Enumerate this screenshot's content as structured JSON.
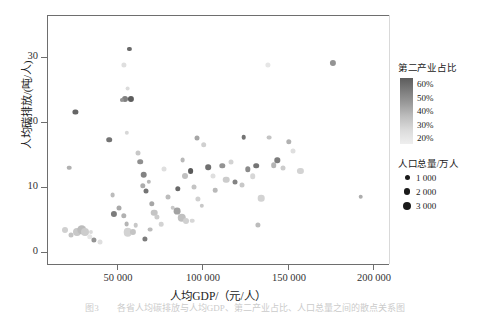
{
  "chart_data": {
    "type": "scatter",
    "title": "",
    "xlabel": "人均GDP/（元/人）",
    "ylabel": "人均碳排放/(吨/人)",
    "xlim": [
      12000,
      205000
    ],
    "ylim": [
      -1.5,
      34
    ],
    "xticks": [
      50000,
      100000,
      150000,
      200000
    ],
    "xticklabels": [
      "50 000",
      "100 000",
      "150 000",
      "200 000"
    ],
    "yticks": [
      0,
      10,
      20,
      30
    ],
    "yticklabels": [
      "0",
      "10",
      "20",
      "30"
    ],
    "grid": false,
    "legend_position": "right",
    "color_variable": "第二产业占比",
    "size_variable": "人口总量/万人",
    "points": [
      {
        "x": 28000,
        "y": 20.2,
        "c": 0.56,
        "s": 5.2
      },
      {
        "x": 24500,
        "y": 12.2,
        "c": 0.36,
        "s": 4.6
      },
      {
        "x": 22000,
        "y": 3.3,
        "c": 0.28,
        "s": 6.0
      },
      {
        "x": 25500,
        "y": 2.6,
        "c": 0.31,
        "s": 5.0
      },
      {
        "x": 29000,
        "y": 3.0,
        "c": 0.3,
        "s": 8.0
      },
      {
        "x": 31500,
        "y": 3.4,
        "c": 0.33,
        "s": 9.5
      },
      {
        "x": 33500,
        "y": 3.0,
        "c": 0.29,
        "s": 8.0
      },
      {
        "x": 36000,
        "y": 2.4,
        "c": 0.22,
        "s": 5.5
      },
      {
        "x": 38500,
        "y": 2.0,
        "c": 0.44,
        "s": 5.2
      },
      {
        "x": 37000,
        "y": 3.1,
        "c": 0.25,
        "s": 4.2
      },
      {
        "x": 42000,
        "y": 1.6,
        "c": 0.24,
        "s": 5.0
      },
      {
        "x": 47000,
        "y": 16.2,
        "c": 0.52,
        "s": 5.6
      },
      {
        "x": 50000,
        "y": 5.6,
        "c": 0.5,
        "s": 6.2
      },
      {
        "x": 49000,
        "y": 8.3,
        "c": 0.33,
        "s": 4.8
      },
      {
        "x": 52500,
        "y": 6.5,
        "c": 0.38,
        "s": 5.0
      },
      {
        "x": 55500,
        "y": 5.4,
        "c": 0.36,
        "s": 5.4
      },
      {
        "x": 57000,
        "y": 4.2,
        "c": 0.35,
        "s": 4.8
      },
      {
        "x": 57500,
        "y": 3.0,
        "c": 0.27,
        "s": 8.5
      },
      {
        "x": 60500,
        "y": 3.1,
        "c": 0.31,
        "s": 6.2
      },
      {
        "x": 62000,
        "y": 4.0,
        "c": 0.3,
        "s": 4.6
      },
      {
        "x": 58500,
        "y": 29.2,
        "c": 0.55,
        "s": 4.2
      },
      {
        "x": 55500,
        "y": 26.9,
        "c": 0.24,
        "s": 5.2
      },
      {
        "x": 57500,
        "y": 23.5,
        "c": 0.25,
        "s": 4.8
      },
      {
        "x": 56000,
        "y": 22.0,
        "c": 0.49,
        "s": 6.0
      },
      {
        "x": 59500,
        "y": 22.0,
        "c": 0.58,
        "s": 6.2
      },
      {
        "x": 54500,
        "y": 21.9,
        "c": 0.44,
        "s": 4.2
      },
      {
        "x": 57000,
        "y": 17.2,
        "c": 0.26,
        "s": 4.4
      },
      {
        "x": 63500,
        "y": 14.3,
        "c": 0.3,
        "s": 5.0
      },
      {
        "x": 64500,
        "y": 13.1,
        "c": 0.45,
        "s": 5.6
      },
      {
        "x": 66500,
        "y": 11.2,
        "c": 0.48,
        "s": 6.6
      },
      {
        "x": 66000,
        "y": 9.6,
        "c": 0.37,
        "s": 5.4
      },
      {
        "x": 68000,
        "y": 8.9,
        "c": 0.52,
        "s": 5.0
      },
      {
        "x": 69500,
        "y": 10.2,
        "c": 0.34,
        "s": 4.4
      },
      {
        "x": 71000,
        "y": 7.1,
        "c": 0.39,
        "s": 5.4
      },
      {
        "x": 72500,
        "y": 5.8,
        "c": 0.31,
        "s": 6.6
      },
      {
        "x": 74000,
        "y": 5.2,
        "c": 0.29,
        "s": 5.2
      },
      {
        "x": 76500,
        "y": 4.2,
        "c": 0.27,
        "s": 4.6
      },
      {
        "x": 70000,
        "y": 3.4,
        "c": 0.33,
        "s": 4.8
      },
      {
        "x": 67000,
        "y": 2.1,
        "c": 0.5,
        "s": 5.2
      },
      {
        "x": 78000,
        "y": 12.0,
        "c": 0.24,
        "s": 5.0
      },
      {
        "x": 80500,
        "y": 8.0,
        "c": 0.33,
        "s": 5.0
      },
      {
        "x": 83000,
        "y": 6.5,
        "c": 0.3,
        "s": 4.6
      },
      {
        "x": 85500,
        "y": 6.0,
        "c": 0.4,
        "s": 6.8
      },
      {
        "x": 88000,
        "y": 5.1,
        "c": 0.32,
        "s": 8.5
      },
      {
        "x": 90500,
        "y": 4.6,
        "c": 0.28,
        "s": 6.0
      },
      {
        "x": 86000,
        "y": 9.2,
        "c": 0.55,
        "s": 5.4
      },
      {
        "x": 88500,
        "y": 13.3,
        "c": 0.34,
        "s": 4.8
      },
      {
        "x": 90000,
        "y": 11.1,
        "c": 0.32,
        "s": 6.0
      },
      {
        "x": 93000,
        "y": 11.7,
        "c": 0.59,
        "s": 5.8
      },
      {
        "x": 95000,
        "y": 9.5,
        "c": 0.31,
        "s": 5.0
      },
      {
        "x": 97000,
        "y": 7.8,
        "c": 0.28,
        "s": 5.2
      },
      {
        "x": 99500,
        "y": 6.8,
        "c": 0.3,
        "s": 4.4
      },
      {
        "x": 94000,
        "y": 4.7,
        "c": 0.26,
        "s": 4.6
      },
      {
        "x": 96500,
        "y": 16.4,
        "c": 0.39,
        "s": 5.0
      },
      {
        "x": 100500,
        "y": 15.5,
        "c": 0.28,
        "s": 5.6
      },
      {
        "x": 103000,
        "y": 12.3,
        "c": 0.53,
        "s": 5.6
      },
      {
        "x": 105500,
        "y": 11.1,
        "c": 0.24,
        "s": 5.0
      },
      {
        "x": 107000,
        "y": 9.0,
        "c": 0.34,
        "s": 4.6
      },
      {
        "x": 111000,
        "y": 12.5,
        "c": 0.44,
        "s": 5.4
      },
      {
        "x": 113000,
        "y": 10.5,
        "c": 0.29,
        "s": 6.6
      },
      {
        "x": 116000,
        "y": 13.0,
        "c": 0.27,
        "s": 5.0
      },
      {
        "x": 118000,
        "y": 10.2,
        "c": 0.48,
        "s": 5.0
      },
      {
        "x": 123000,
        "y": 16.6,
        "c": 0.52,
        "s": 4.6
      },
      {
        "x": 122000,
        "y": 9.7,
        "c": 0.3,
        "s": 5.0
      },
      {
        "x": 125500,
        "y": 12.0,
        "c": 0.46,
        "s": 5.4
      },
      {
        "x": 128000,
        "y": 11.0,
        "c": 0.26,
        "s": 5.6
      },
      {
        "x": 130000,
        "y": 12.5,
        "c": 0.52,
        "s": 5.6
      },
      {
        "x": 133000,
        "y": 7.9,
        "c": 0.27,
        "s": 6.6
      },
      {
        "x": 131000,
        "y": 4.1,
        "c": 0.33,
        "s": 5.2
      },
      {
        "x": 136500,
        "y": 26.9,
        "c": 0.22,
        "s": 5.2
      },
      {
        "x": 137500,
        "y": 16.5,
        "c": 0.31,
        "s": 4.8
      },
      {
        "x": 140000,
        "y": 12.6,
        "c": 0.35,
        "s": 5.6
      },
      {
        "x": 142000,
        "y": 13.3,
        "c": 0.5,
        "s": 5.4
      },
      {
        "x": 145000,
        "y": 12.2,
        "c": 0.29,
        "s": 5.0
      },
      {
        "x": 148500,
        "y": 15.9,
        "c": 0.36,
        "s": 5.4
      },
      {
        "x": 151000,
        "y": 14.6,
        "c": 0.24,
        "s": 5.0
      },
      {
        "x": 155000,
        "y": 11.8,
        "c": 0.27,
        "s": 6.2
      },
      {
        "x": 173500,
        "y": 27.2,
        "c": 0.44,
        "s": 6.2
      },
      {
        "x": 189000,
        "y": 8.1,
        "c": 0.37,
        "s": 4.6
      }
    ]
  },
  "axes": {
    "ylabel": "人均碳排放/(吨/人)",
    "xlabel": "人均GDP/（元/人）",
    "yticklabels": [
      "30",
      "20",
      "10",
      "0"
    ],
    "xticklabels": [
      "50 000",
      "100 000",
      "150 000",
      "200 000"
    ]
  },
  "legend": {
    "color": {
      "title": "第二产业占比",
      "ticks": [
        "60%",
        "50%",
        "40%",
        "30%",
        "20%"
      ]
    },
    "size": {
      "title": "人口总量/万人",
      "items": [
        {
          "label": "1 000",
          "dot": 5
        },
        {
          "label": "2 000",
          "dot": 6.5
        },
        {
          "label": "3 000",
          "dot": 8
        }
      ]
    }
  },
  "caption": {
    "text": "图3　　各省人均碳排放与人均GDP、第二产业占比、人口总量之间的散点关系图"
  }
}
